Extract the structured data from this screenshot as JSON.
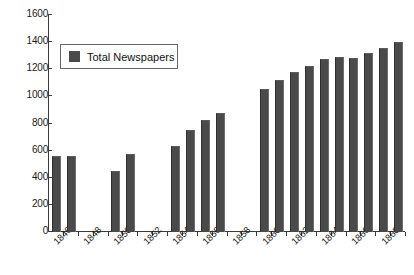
{
  "chart_data": {
    "type": "bar",
    "title": "",
    "xlabel": "",
    "ylabel": "",
    "ylim": [
      0,
      1600
    ],
    "ytick_step": 200,
    "yticks": [
      0,
      200,
      400,
      600,
      800,
      1000,
      1200,
      1400,
      1600
    ],
    "ytick_labels": [
      "0",
      "200",
      "400",
      "600",
      "800",
      "1000",
      "1200",
      "1400",
      "1600"
    ],
    "grid": false,
    "legend": {
      "position": "top-left-inside",
      "entries": [
        {
          "name": "Total Newspapers",
          "color": "#4a4a4a",
          "marker": "square"
        }
      ]
    },
    "series": [
      {
        "name": "Total Newspapers",
        "color": "#4a4a4a",
        "values": [
          550,
          552,
          null,
          null,
          445,
          565,
          null,
          null,
          630,
          745,
          820,
          870,
          null,
          1050,
          1110,
          1175,
          1220,
          1265,
          1280,
          1275,
          1310,
          1350,
          1390
        ]
      }
    ],
    "categories": [
      "1846",
      "1847",
      "1848",
      "1849",
      "1850",
      "1851",
      "1852",
      "1853",
      "1854",
      "1855",
      "1856",
      "1857",
      "1858",
      "1859",
      "1860",
      "1861",
      "1862",
      "1863",
      "1864",
      "1865",
      "1866",
      "1867",
      "1868"
    ],
    "xtick_labels_shown": [
      "1846",
      "1848",
      "1850",
      "1852",
      "1854",
      "1856",
      "1858",
      "1860",
      "1862",
      "1864",
      "1866",
      "1868"
    ],
    "bars": [
      {
        "category": "1846",
        "value": 550
      },
      {
        "category": "1847",
        "value": 552
      },
      {
        "category": "1850",
        "value": 445
      },
      {
        "category": "1851",
        "value": 565
      },
      {
        "category": "1854",
        "value": 630
      },
      {
        "category": "1855",
        "value": 745
      },
      {
        "category": "1856",
        "value": 820
      },
      {
        "category": "1857",
        "value": 870
      },
      {
        "category": "1860",
        "value": 1050
      },
      {
        "category": "1861",
        "value": 1110
      },
      {
        "category": "1862",
        "value": 1175
      },
      {
        "category": "1863",
        "value": 1220
      },
      {
        "category": "1864",
        "value": 1265
      },
      {
        "category": "1865",
        "value": 1280
      },
      {
        "category": "1866",
        "value": 1275
      },
      {
        "category": "1867",
        "value": 1310
      },
      {
        "category": "1868",
        "value": 1350
      },
      {
        "category": "1869",
        "value": 1390
      }
    ]
  },
  "legend": {
    "label": "Total Newspapers"
  },
  "colors": {
    "bar": "#4a4a4a",
    "axis": "#3a3a3a",
    "text": "#1a1a1a",
    "background": "#ffffff"
  }
}
